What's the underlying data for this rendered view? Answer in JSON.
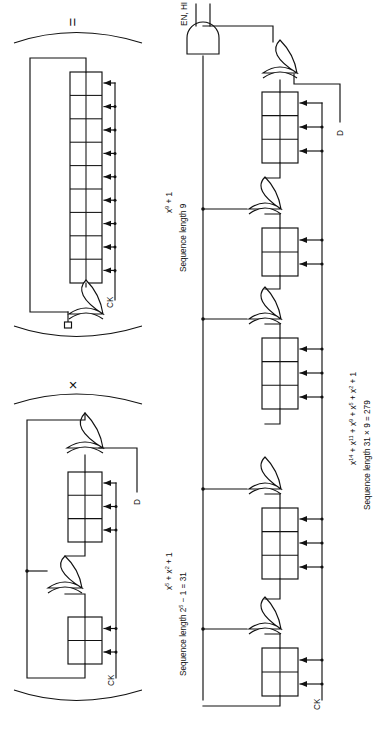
{
  "figure": {
    "orientation": "rotated-90-ccw",
    "background": "#ffffff",
    "ink": "#111111"
  },
  "operators": {
    "equals": "=",
    "times": "×"
  },
  "blocks": [
    {
      "id": "block-a",
      "role": "nine-stage-shift-register",
      "stages": 9,
      "polynomial": "x⁹ + 1",
      "poly_base": "x",
      "poly_exp": "9",
      "poly_tail": " + 1",
      "sequence_caption": "Sequence length 9",
      "clock_label": "CK",
      "data_label": "D",
      "gate": "XOR"
    },
    {
      "id": "block-b",
      "role": "five-stage-lfsr",
      "stages": 5,
      "polynomial": "x⁵ + x² + 1",
      "sequence_caption": "Sequence length 2⁵ − 1 = 31",
      "clock_label": "CK",
      "data_label": "D",
      "gate": "XOR"
    },
    {
      "id": "block-c",
      "role": "fourteen-stage-composite-lfsr",
      "stages": 14,
      "polynomial": "x¹⁴ + x¹¹ + x⁹ + x⁵ + x² + 1",
      "sequence_caption": "Sequence length 31 × 9 = 279",
      "clock_label": "CK",
      "data_label": "D",
      "enable_label": "EN, HI",
      "gate": "XOR",
      "enable_gate": "AND"
    }
  ],
  "labels": {
    "ck": "CK",
    "d": "D",
    "en_hi": "EN, HI",
    "poly_a_main": "x",
    "poly_a_sup": "9",
    "poly_a_rest": " + 1",
    "seq_a": "Sequence length 9",
    "seq_b": "Sequence length 2",
    "seq_b_sup": "5",
    "seq_b_rest": " − 1 = 31",
    "poly_b_1": "x",
    "poly_b_1s": "5",
    "poly_b_2": " + x",
    "poly_b_2s": "2",
    "poly_b_3": " + 1",
    "seq_c": "Sequence length 31 × 9 = 279",
    "poly_c_1": "x",
    "poly_c_1s": "14",
    "poly_c_2": " + x",
    "poly_c_2s": "11",
    "poly_c_3": " + x",
    "poly_c_3s": "9",
    "poly_c_4": " + x",
    "poly_c_4s": "5",
    "poly_c_5": " + x",
    "poly_c_5s": "2",
    "poly_c_6": " + 1"
  }
}
